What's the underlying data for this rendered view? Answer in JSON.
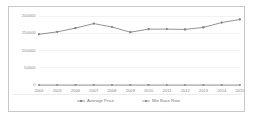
{
  "chart_data": {
    "type": "line",
    "title": "",
    "subtitle": "",
    "xlabel": "",
    "ylabel": "",
    "categories": [
      "2004",
      "2005",
      "2006",
      "2007",
      "2008",
      "2009",
      "2010",
      "2011",
      "2012",
      "2013",
      "2014",
      "2015"
    ],
    "x": [
      2004,
      2005,
      2006,
      2007,
      2008,
      2009,
      2010,
      2011,
      2012,
      2013,
      2014,
      2015
    ],
    "ylim": [
      0,
      200000
    ],
    "yticks": [
      0,
      50000,
      100000,
      150000,
      200000
    ],
    "ytick_labels": [
      "0",
      "50000",
      "100000",
      "150000",
      "200000"
    ],
    "grid": true,
    "legend_position": "bottom",
    "series": [
      {
        "name": "Average Price",
        "color": "#808080",
        "marker": "square",
        "values": [
          147000,
          154000,
          165000,
          178000,
          168000,
          153000,
          162000,
          162000,
          161000,
          167000,
          181000,
          190000
        ]
      },
      {
        "name": "Min Base Rate",
        "color": "#909090",
        "marker": "square",
        "values": [
          0,
          0,
          0,
          0,
          0,
          0,
          0,
          0,
          0,
          0,
          0,
          0
        ]
      }
    ]
  },
  "legend": {
    "items": [
      {
        "label": "Average Price"
      },
      {
        "label": "Min Base Rate"
      }
    ]
  },
  "axes": {
    "y_labels": [
      "200000",
      "150000",
      "100000",
      "50000",
      "0"
    ],
    "x_labels": [
      "2004",
      "2005",
      "2006",
      "2007",
      "2008",
      "2009",
      "2010",
      "2011",
      "2012",
      "2013",
      "2014",
      "2015"
    ]
  }
}
